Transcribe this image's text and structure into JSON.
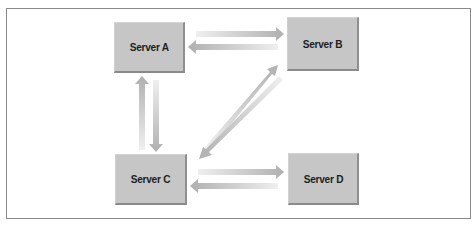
{
  "diagram": {
    "title": "",
    "colors": {
      "frame_border": "#8a8a8a",
      "server_fill": "#c6c6c6",
      "server_shadow": "#8a8a8a",
      "arrow_dark": "#b3b3b3",
      "arrow_light": "#ececec",
      "text": "#1e1e1e"
    },
    "servers": [
      {
        "id": "A",
        "label": "Server A",
        "x": 114,
        "y": 22,
        "w": 71,
        "h": 51
      },
      {
        "id": "B",
        "label": "Server B",
        "x": 287,
        "y": 17,
        "w": 72,
        "h": 54
      },
      {
        "id": "C",
        "label": "Server C",
        "x": 115,
        "y": 154,
        "w": 72,
        "h": 51
      },
      {
        "id": "D",
        "label": "Server D",
        "x": 288,
        "y": 153,
        "w": 71,
        "h": 52
      }
    ],
    "connections": [
      {
        "from": "A",
        "to": "B",
        "direction": "right"
      },
      {
        "from": "B",
        "to": "A",
        "direction": "left"
      },
      {
        "from": "C",
        "to": "A",
        "direction": "up"
      },
      {
        "from": "A",
        "to": "C",
        "direction": "down"
      },
      {
        "from": "C",
        "to": "B",
        "direction": "up-right"
      },
      {
        "from": "B",
        "to": "C",
        "direction": "down-left"
      },
      {
        "from": "C",
        "to": "D",
        "direction": "right"
      },
      {
        "from": "D",
        "to": "C",
        "direction": "left"
      }
    ]
  }
}
